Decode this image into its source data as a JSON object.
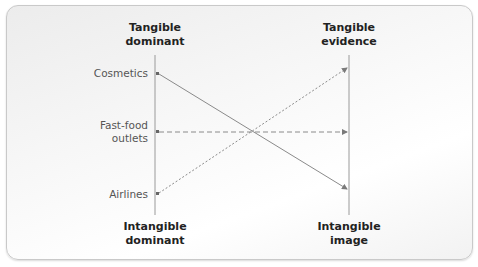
{
  "diagram": {
    "left_axis": {
      "top_label_line1": "Tangible",
      "top_label_line2": "dominant",
      "bottom_label_line1": "Intangible",
      "bottom_label_line2": "dominant"
    },
    "right_axis": {
      "top_label_line1": "Tangible",
      "top_label_line2": "evidence",
      "bottom_label_line1": "Intangible",
      "bottom_label_line2": "image"
    },
    "items": [
      {
        "label": "Cosmetics",
        "line_style": "solid",
        "from": "Tangible dominant end",
        "to": "Intangible image"
      },
      {
        "label_line1": "Fast-food",
        "label_line2": "outlets",
        "line_style": "dashed",
        "from": "Middle",
        "to": "Middle"
      },
      {
        "label": "Airlines",
        "line_style": "dotted",
        "from": "Intangible dominant end",
        "to": "Tangible evidence"
      }
    ],
    "colors": {
      "line": "#8a8a8a",
      "text": "#555555",
      "heading": "#222222",
      "panel_border": "#c9c9c9"
    }
  }
}
